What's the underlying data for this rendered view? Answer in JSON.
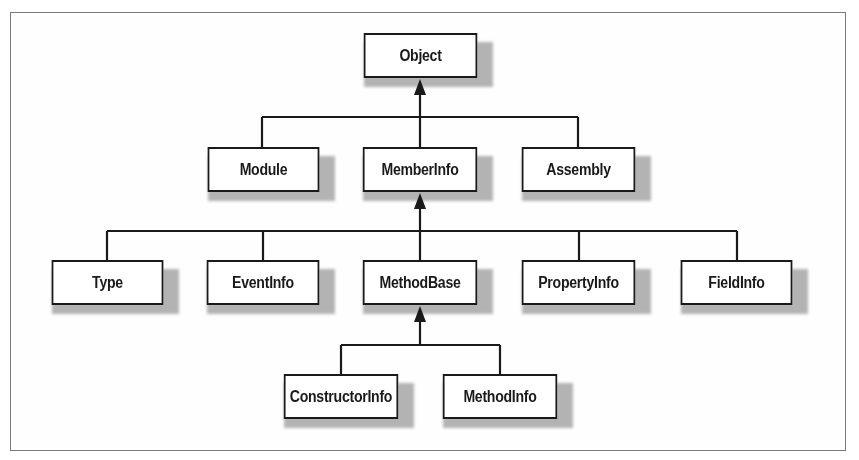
{
  "diagram": {
    "type": "class-hierarchy",
    "nodes": {
      "object": "Object",
      "module": "Module",
      "memberinfo": "MemberInfo",
      "assembly": "Assembly",
      "type": "Type",
      "eventinfo": "EventInfo",
      "methodbase": "MethodBase",
      "propertyinfo": "PropertyInfo",
      "fieldinfo": "FieldInfo",
      "constructorinfo": "ConstructorInfo",
      "methodinfo": "MethodInfo"
    },
    "edges": [
      {
        "from": "Module",
        "to": "Object"
      },
      {
        "from": "MemberInfo",
        "to": "Object"
      },
      {
        "from": "Assembly",
        "to": "Object"
      },
      {
        "from": "Type",
        "to": "MemberInfo"
      },
      {
        "from": "EventInfo",
        "to": "MemberInfo"
      },
      {
        "from": "MethodBase",
        "to": "MemberInfo"
      },
      {
        "from": "PropertyInfo",
        "to": "MemberInfo"
      },
      {
        "from": "FieldInfo",
        "to": "MemberInfo"
      },
      {
        "from": "ConstructorInfo",
        "to": "MethodBase"
      },
      {
        "from": "MethodInfo",
        "to": "MethodBase"
      }
    ],
    "colors": {
      "line": "#1a1a1a",
      "box_fill": "#ffffff",
      "shadow": "#9a9a9a",
      "frame": "#7a7a7a"
    }
  }
}
